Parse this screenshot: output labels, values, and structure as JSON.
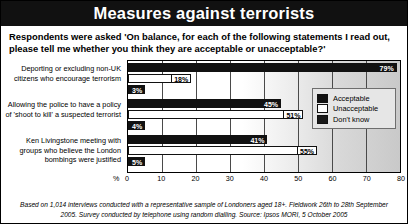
{
  "header": {
    "title": "Measures against terrorists"
  },
  "subtitle": "Respondents were asked 'On balance, for each of the following statements I read out, please tell me whether you think they are acceptable or unacceptable?'",
  "footnote": "Based on 1,014 interviews conducted with a representative sample of Londoners aged 18+. Fieldwork 26th to 28th September 2005. Survey conducted by telephone using random dialling. Source: Ipsos MORI, 5 October 2005",
  "legend": {
    "position": "right-inside",
    "items": [
      {
        "label": "Acceptable",
        "color": "#111111",
        "swatch": "sw-acc"
      },
      {
        "label": "Unacceptable",
        "color": "#ffffff",
        "swatch": "sw-unacc"
      },
      {
        "label": "Don't know",
        "color": "#1a1a1a",
        "swatch": "sw-dk"
      }
    ]
  },
  "axis": {
    "unit_symbol": "%",
    "ticks": [
      "0",
      "10",
      "20",
      "30",
      "40",
      "50",
      "60",
      "70",
      "80"
    ]
  },
  "chart_data": {
    "type": "bar",
    "orientation": "horizontal",
    "title": "Measures against terrorists",
    "xlabel": "%",
    "ylabel": "",
    "xlim": [
      0,
      80
    ],
    "grid": true,
    "categories": [
      "Deporting or excluding non-UK citizens who encourage terrorism",
      "Allowing the police to have a policy of 'shoot to kill' a suspected terrorist",
      "Ken Livingstone meeting with groups who believe the London bombings were justified"
    ],
    "series": [
      {
        "name": "Acceptable",
        "values": [
          79,
          45,
          41
        ],
        "labels": [
          "79%",
          "45%",
          "41%"
        ]
      },
      {
        "name": "Unacceptable",
        "values": [
          18,
          51,
          55
        ],
        "labels": [
          "18%",
          "51%",
          "55%"
        ]
      },
      {
        "name": "Don't know",
        "values": [
          3,
          4,
          5
        ],
        "labels": [
          "3%",
          "4%",
          "5%"
        ]
      }
    ]
  }
}
